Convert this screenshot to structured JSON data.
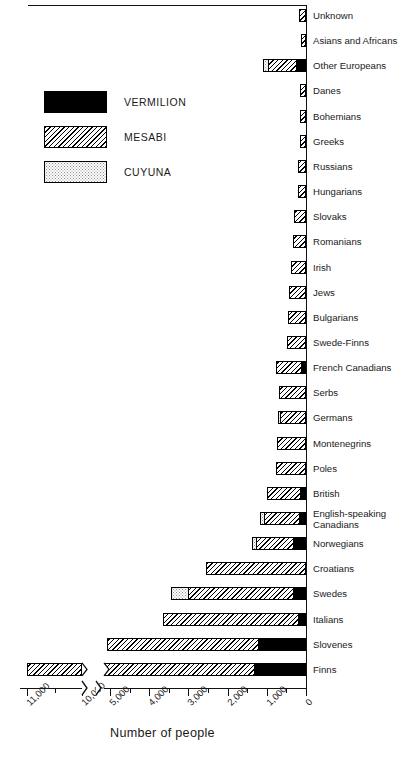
{
  "legend": {
    "items": [
      {
        "label": "VERMILION",
        "key": "vermilion",
        "color": "#000000"
      },
      {
        "label": "MESABI",
        "key": "mesabi",
        "color": "#000000"
      },
      {
        "label": "CUYUNA",
        "key": "cuyuna",
        "color": "#8d8d8d"
      }
    ]
  },
  "axis": {
    "title": "Number of people",
    "tick_labels": [
      "11,000",
      "10,000",
      "5,000",
      "4,000",
      "3,000",
      "2,000",
      "1,000",
      "0"
    ],
    "zero_label": "0",
    "broken": true
  },
  "chart_data": {
    "type": "bar",
    "orientation": "horizontal-stacked-right-to-left",
    "title": "",
    "xlabel": "Number of people",
    "ylabel": "",
    "xlim": [
      0,
      5400
    ],
    "xlim_outlier": [
      9600,
      11400
    ],
    "grid": false,
    "legend_position": "upper-left",
    "axis_break": {
      "between": [
        5400,
        9600
      ],
      "note": "axis broken; Finns bar continues past break to ~11,000"
    },
    "series": [
      {
        "name": "VERMILION",
        "key": "vermilion"
      },
      {
        "name": "MESABI",
        "key": "mesabi"
      },
      {
        "name": "CUYUNA",
        "key": "cuyuna"
      }
    ],
    "categories": [
      "Unknown",
      "Asians and Africans",
      "Other Europeans",
      "Danes",
      "Bohemians",
      "Greeks",
      "Russians",
      "Hungarians",
      "Slovaks",
      "Romanians",
      "Irish",
      "Jews",
      "Bulgarians",
      "Swede-Finns",
      "French Canadians",
      "Serbs",
      "Germans",
      "Montenegrins",
      "Poles",
      "British",
      "English-speaking Canadians",
      "Norwegians",
      "Croatians",
      "Swedes",
      "Italians",
      "Slovenes",
      "Finns"
    ],
    "rows": [
      {
        "category": "Unknown",
        "vermilion": 0,
        "mesabi": 175,
        "cuyuna": 0,
        "total": 175
      },
      {
        "category": "Asians and Africans",
        "vermilion": 0,
        "mesabi": 140,
        "cuyuna": 0,
        "total": 140
      },
      {
        "category": "Other Europeans",
        "vermilion": 260,
        "mesabi": 700,
        "cuyuna": 130,
        "total": 1090
      },
      {
        "category": "Danes",
        "vermilion": 0,
        "mesabi": 155,
        "cuyuna": 0,
        "total": 155
      },
      {
        "category": "Bohemians",
        "vermilion": 0,
        "mesabi": 160,
        "cuyuna": 0,
        "total": 160
      },
      {
        "category": "Greeks",
        "vermilion": 0,
        "mesabi": 160,
        "cuyuna": 0,
        "total": 160
      },
      {
        "category": "Russians",
        "vermilion": 0,
        "mesabi": 205,
        "cuyuna": 0,
        "total": 205
      },
      {
        "category": "Hungarians",
        "vermilion": 0,
        "mesabi": 215,
        "cuyuna": 0,
        "total": 215
      },
      {
        "category": "Slovaks",
        "vermilion": 0,
        "mesabi": 310,
        "cuyuna": 0,
        "total": 310
      },
      {
        "category": "Romanians",
        "vermilion": 0,
        "mesabi": 320,
        "cuyuna": 0,
        "total": 320
      },
      {
        "category": "Irish",
        "vermilion": 0,
        "mesabi": 390,
        "cuyuna": 0,
        "total": 390
      },
      {
        "category": "Jews",
        "vermilion": 0,
        "mesabi": 440,
        "cuyuna": 0,
        "total": 440
      },
      {
        "category": "Bulgarians",
        "vermilion": 0,
        "mesabi": 465,
        "cuyuna": 0,
        "total": 465
      },
      {
        "category": "Swede-Finns",
        "vermilion": 0,
        "mesabi": 490,
        "cuyuna": 0,
        "total": 490
      },
      {
        "category": "French Canadians",
        "vermilion": 135,
        "mesabi": 620,
        "cuyuna": 0,
        "total": 755
      },
      {
        "category": "Serbs",
        "vermilion": 0,
        "mesabi": 690,
        "cuyuna": 0,
        "total": 690
      },
      {
        "category": "Germans",
        "vermilion": 0,
        "mesabi": 660,
        "cuyuna": 65,
        "total": 725
      },
      {
        "category": "Montenegrins",
        "vermilion": 0,
        "mesabi": 745,
        "cuyuna": 0,
        "total": 745
      },
      {
        "category": "Poles",
        "vermilion": 0,
        "mesabi": 760,
        "cuyuna": 0,
        "total": 760
      },
      {
        "category": "British",
        "vermilion": 160,
        "mesabi": 830,
        "cuyuna": 0,
        "total": 990
      },
      {
        "category": "English-speaking Canadians",
        "vermilion": 180,
        "mesabi": 890,
        "cuyuna": 100,
        "total": 1170
      },
      {
        "category": "Norwegians",
        "vermilion": 325,
        "mesabi": 960,
        "cuyuna": 90,
        "total": 1375
      },
      {
        "category": "Croatians",
        "vermilion": 0,
        "mesabi": 2550,
        "cuyuna": 0,
        "total": 2550
      },
      {
        "category": "Swedes",
        "vermilion": 335,
        "mesabi": 2680,
        "cuyuna": 430,
        "total": 3445
      },
      {
        "category": "Italians",
        "vermilion": 195,
        "mesabi": 3455,
        "cuyuna": 0,
        "total": 3650
      },
      {
        "category": "Slovenes",
        "vermilion": 1215,
        "mesabi": 3850,
        "cuyuna": 0,
        "total": 5065
      },
      {
        "category": "Finns",
        "vermilion": 1320,
        "mesabi": 9680,
        "cuyuna": 0,
        "total": 11000
      }
    ]
  }
}
